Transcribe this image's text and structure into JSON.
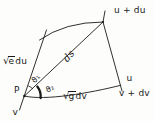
{
  "figure": {
    "background": "#fdfdfc",
    "ink": "#1a1a1a",
    "labels": {
      "point_p": "P",
      "curve_v": "v",
      "curve_v_plus_dv": "v + dv",
      "curve_u": "u",
      "curve_u_plus_du": "u + du",
      "arc_element_ds": "ds",
      "angle_theta1": "ϑ₁",
      "angle_theta2": "ϑ₂",
      "sqrt_e_du": {
        "radical": "√",
        "radicand": "e",
        "rest": "du"
      },
      "sqrt_g_dv": {
        "radical": "√",
        "radicand": "g",
        "rest": "dv"
      }
    }
  }
}
